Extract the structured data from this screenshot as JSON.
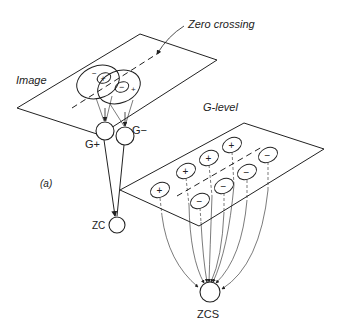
{
  "labels": {
    "zero_crossing": "Zero crossing",
    "image": "Image",
    "g_level": "G-level",
    "g_plus": "G+",
    "g_minus": "G−",
    "zc": "ZC",
    "zcs": "ZCS",
    "panel_a": "(a)",
    "panel_b": "(b)"
  },
  "image_plane": {
    "rf_plus_center": "+",
    "rf_plus_surround": "−",
    "rf_minus_center": "−",
    "rf_minus_surround": "+"
  },
  "g_level_plane": {
    "plus_units": [
      "+",
      "+",
      "+",
      "+"
    ],
    "minus_units": [
      "−",
      "−",
      "−",
      "−"
    ]
  },
  "colors": {
    "stroke": "#222222",
    "background": "#ffffff"
  }
}
